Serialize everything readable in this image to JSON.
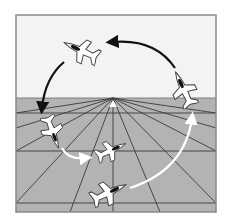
{
  "diagram": {
    "type": "aerobatic-maneuver",
    "description": "Loop maneuver shown over a perspective ground grid",
    "colors": {
      "sky": "#f3f3f3",
      "ground": "#b3b3b3",
      "frame": "#8a8a8a",
      "grid_line": "#3a3a3a",
      "arrow_dark": "#111111",
      "arrow_light": "#ffffff",
      "aircraft_fill": "#ffffff",
      "aircraft_outline": "#444444",
      "cockpit": "#111111"
    },
    "horizon_y": 98,
    "vanishing_point": [
      113,
      98
    ],
    "aircraft": [
      {
        "id": "entry",
        "label": "Entry, level flight",
        "x": 92,
        "y": 190,
        "angle": -25
      },
      {
        "id": "climb",
        "label": "Pull-up, nose high",
        "x": 185,
        "y": 88,
        "angle": 65
      },
      {
        "id": "inverted",
        "label": "Inverted at top",
        "x": 80,
        "y": 47,
        "angle": 155
      },
      {
        "id": "dive",
        "label": "Nose-down descent",
        "x": 50,
        "y": 130,
        "angle": -110
      },
      {
        "id": "exit",
        "label": "Recovery",
        "x": 108,
        "y": 151,
        "angle": -25
      }
    ],
    "arrows": [
      {
        "id": "arrow-entry-to-climb",
        "tone": "light"
      },
      {
        "id": "arrow-climb-to-top",
        "tone": "dark"
      },
      {
        "id": "arrow-top-to-dive",
        "tone": "dark"
      },
      {
        "id": "arrow-dive-to-exit",
        "tone": "light"
      }
    ]
  }
}
